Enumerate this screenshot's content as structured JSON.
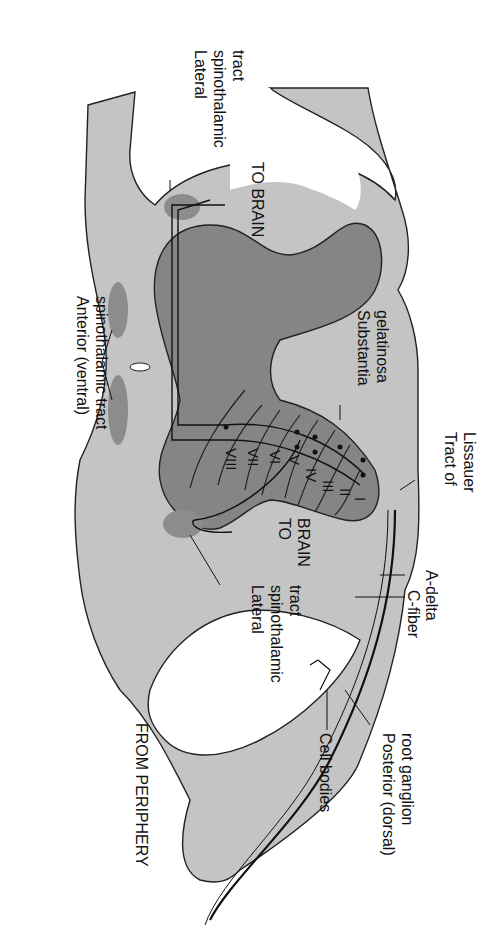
{
  "diagram": {
    "orientation": "rotated 90 degrees clockwise",
    "colors": {
      "white_matter": "#c4c4c4",
      "gray_matter": "#858585",
      "tract": "#8c8c8c",
      "outline": "#222222",
      "background": "#ffffff"
    },
    "labels": {
      "lateral_tract_top": [
        "Lateral",
        "spinothalamic",
        "tract"
      ],
      "anterior_tract": [
        "Anterior (ventral)",
        "spinothalamic tract"
      ],
      "substantia": [
        "Substantia",
        "gelatinosa"
      ],
      "lissauer": [
        "Tract of",
        "Lissauer"
      ],
      "to_brain_top": "TO BRAIN",
      "to_brain_bottom": [
        "TO",
        "BRAIN"
      ],
      "lateral_tract_bottom": [
        "Lateral",
        "spinothalamic",
        "tract"
      ],
      "a_delta": "A-delta",
      "c_fiber": "C-fiber",
      "posterior_ganglion": [
        "Posterior (dorsal)",
        "root ganglion"
      ],
      "cell_bodies": "Cell bodies",
      "from_periphery": "FROM PERIPHERY"
    },
    "laminae": [
      "I",
      "II",
      "III",
      "IV",
      "V",
      "VI",
      "VII",
      "VIII"
    ]
  }
}
